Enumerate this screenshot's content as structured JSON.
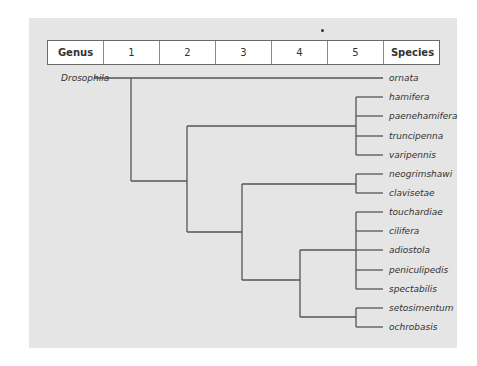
{
  "diagram": {
    "type": "phylogenetic-tree",
    "header": {
      "columns": [
        "Genus",
        "1",
        "2",
        "3",
        "4",
        "5",
        "Species"
      ]
    },
    "root_label": "Drosophila",
    "species": [
      "ornata",
      "hamifera",
      "paenehamifera",
      "truncipenna",
      "varipennis",
      "neogrimshawi",
      "clavisetae",
      "touchardiae",
      "cilifera",
      "adiostola",
      "peniculipedis",
      "spectabilis",
      "setosimentum",
      "ochrobasis"
    ],
    "clades": [
      {
        "level": 1,
        "members": [
          "ornata",
          "rest"
        ]
      },
      {
        "level": 2,
        "members": [
          "hamifera",
          "paenehamifera",
          "truncipenna",
          "varipennis"
        ]
      },
      {
        "level": 3,
        "members": [
          "neogrimshawi",
          "clavisetae"
        ]
      },
      {
        "level": 4,
        "members": [
          "touchardiae",
          "cilifera",
          "adiostola",
          "peniculipedis",
          "spectabilis"
        ]
      },
      {
        "level": 4,
        "members": [
          "setosimentum",
          "ochrobasis"
        ]
      }
    ],
    "colors": {
      "panel": "#e5e5e5",
      "line": "#555555",
      "header_bg": "#ffffff"
    }
  }
}
